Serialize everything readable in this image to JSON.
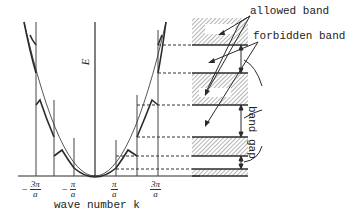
{
  "figure": {
    "axis_x_label": "wave number k",
    "axis_y_label": "E",
    "ticks": [
      {
        "sign": "−",
        "num": "3π",
        "den": "a"
      },
      {
        "sign": "−",
        "num": "π",
        "den": "a"
      },
      {
        "sign": "",
        "num": "π",
        "den": "a"
      },
      {
        "sign": "",
        "num": "3π",
        "den": "a"
      }
    ],
    "annotations": {
      "allowed_band": "allowed band",
      "forbidden_band": "forbidden band",
      "band_gap": "band gap"
    },
    "colors": {
      "line": "#2b2b2b",
      "hatch": "#555555",
      "background": "#ffffff"
    }
  }
}
